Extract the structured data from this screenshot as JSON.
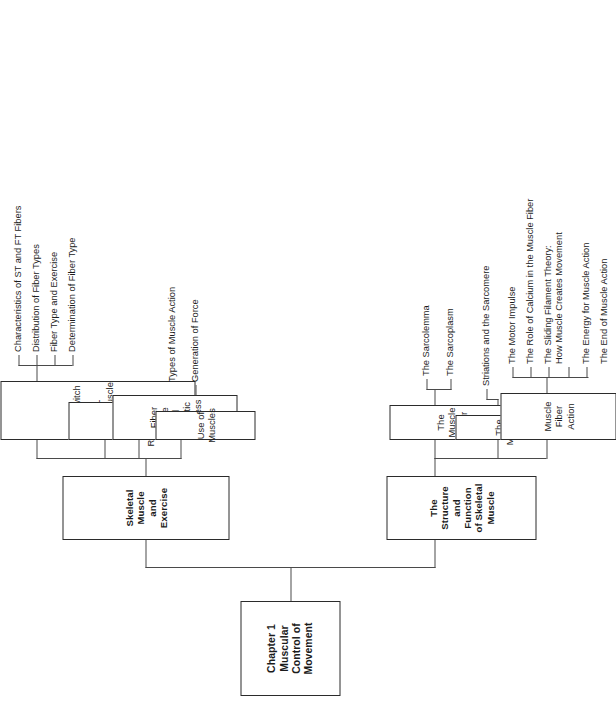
{
  "diagram": {
    "type": "tree",
    "orientation": "rotated-90-counterclockwise",
    "line_color": "#4a4a4a",
    "box_border_color": "#2b2b2b",
    "background": "#ffffff"
  },
  "root": {
    "line1": "Chapter 1",
    "line2": "Muscular Control of Movement"
  },
  "branch_a": {
    "title_line1": "Skeletal Muscle",
    "title_line2": "and Exercise",
    "children": [
      {
        "title_line1": "Slow-Twitch and",
        "title_line2": "Fast-TwitchMuscle",
        "title_line3": "Fibers",
        "leaves": [
          "Characteristics of ST and FT Fibers",
          "Distribution of Fiber Types",
          "Fiber Type and Exercise",
          "Determination of Fiber Type"
        ]
      },
      {
        "title_line1": "Muscle Fiber Recruitment",
        "leaves": []
      },
      {
        "title_line1": "Fiber Type and Athletic",
        "title_line2": "Success",
        "leaves": []
      },
      {
        "title_line1": "Use of Muscles",
        "leaves": [
          "Types of Muscle Action",
          "Generation of Force"
        ]
      }
    ]
  },
  "branch_b": {
    "title_line1": "The Structure",
    "title_line2": "and Function",
    "title_line3": "of Skeletal",
    "title_line4": "Muscle",
    "children": [
      {
        "title_line1": "The Muscle Fiber",
        "leaves": [
          "The Sarcolemma",
          "The Sarcoplasm"
        ]
      },
      {
        "title_line1": "The Myofibril",
        "leaves": [
          "Striations and the Sarcomere"
        ]
      },
      {
        "title_line1": "Muscle Fiber Action",
        "leaves": [
          "The Motor Impulse",
          "The Role of Calcium in the Muscle Fiber",
          "The Sliding Filament Theory:\nHow Muscle Creates Movement",
          "The Energy for Muscle Action",
          "The End of Muscle Action"
        ]
      }
    ]
  }
}
